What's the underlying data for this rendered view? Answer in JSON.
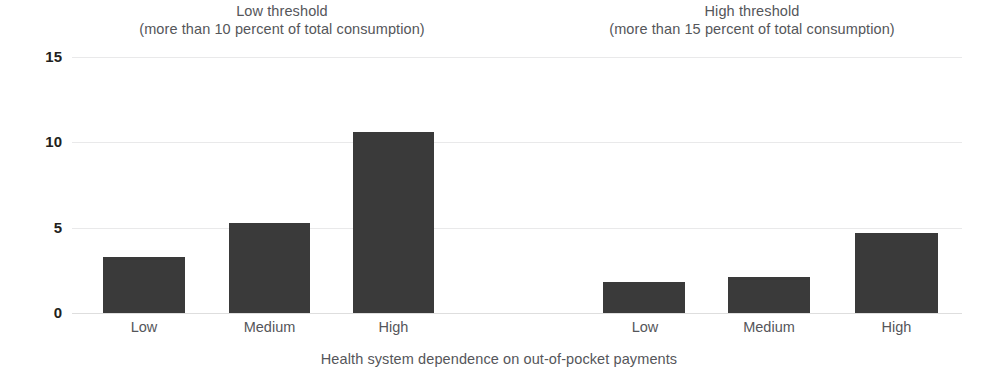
{
  "chart_data": {
    "type": "bar",
    "title": "",
    "xlabel": "Health system dependence on out-of-pocket payments",
    "ylabel": "",
    "ylim": [
      0,
      15
    ],
    "yticks": [
      0,
      5,
      10,
      15
    ],
    "ytick_labels": [
      "0",
      "5",
      "10",
      "15"
    ],
    "grid": true,
    "legend": "none",
    "categories": [
      "Low",
      "Medium",
      "High"
    ],
    "panels": [
      {
        "title_line1": "Low threshold",
        "title_line2": "(more than 10 percent of total consumption)",
        "categories": [
          "Low",
          "Medium",
          "High"
        ],
        "values": [
          3.3,
          5.3,
          10.6
        ]
      },
      {
        "title_line1": "High threshold",
        "title_line2": "(more than 15 percent of total consumption)",
        "categories": [
          "Low",
          "Medium",
          "High"
        ],
        "values": [
          1.8,
          2.1,
          4.7
        ]
      }
    ],
    "bar_color": "#3a3a3a",
    "gridline_color": "#e9e9ea",
    "text_color": "#55565a",
    "tick_color": "#231f20"
  },
  "layout": {
    "plot_left": 72,
    "plot_top": 57,
    "plot_width": 890,
    "plot_height": 256,
    "bar_geometry": [
      {
        "x": 103,
        "w": 82
      },
      {
        "x": 229,
        "w": 81
      },
      {
        "x": 353,
        "w": 81
      },
      {
        "x": 603,
        "w": 82
      },
      {
        "x": 728,
        "w": 82
      },
      {
        "x": 855,
        "w": 83
      }
    ]
  }
}
